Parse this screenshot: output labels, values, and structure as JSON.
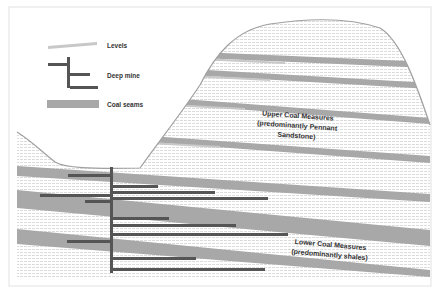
{
  "diagram": {
    "legend": [
      {
        "key": "levels",
        "label": "Levels",
        "color": "#c8c8c8"
      },
      {
        "key": "deep_mine",
        "label": "Deep mine",
        "color": "#555555"
      },
      {
        "key": "coal_seams",
        "label": "Coal seams",
        "color": "#a8a8a8"
      }
    ],
    "labels": {
      "upper_line1": "Upper Coal Measures",
      "upper_line2": "(predominantly Pennant",
      "upper_line3": "Sandstone)",
      "lower_line1": "Lower Coal Measures",
      "lower_line2": "(predominantly shales)"
    },
    "colors": {
      "seam": "#a8a8a8",
      "mine": "#555555",
      "level": "#c8c8c8",
      "hatch": "#dcdcdc",
      "outline": "#a0a0a0",
      "frame": "#e2e2e2"
    }
  }
}
